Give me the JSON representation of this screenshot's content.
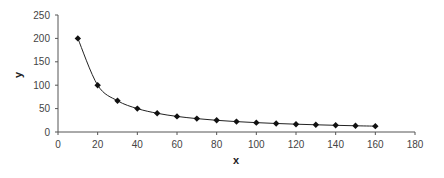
{
  "chart_data": {
    "type": "line",
    "title": "",
    "xlabel": "x",
    "ylabel": "y",
    "xlim": [
      0,
      180
    ],
    "ylim": [
      0,
      250
    ],
    "x_ticks": [
      0,
      20,
      40,
      60,
      80,
      100,
      120,
      140,
      160,
      180
    ],
    "y_ticks": [
      0,
      50,
      100,
      150,
      200,
      250
    ],
    "grid": false,
    "legend": null,
    "marker": "diamond",
    "smooth": true,
    "series": [
      {
        "name": "y",
        "x": [
          10,
          20,
          30,
          40,
          50,
          60,
          70,
          80,
          90,
          100,
          110,
          120,
          130,
          140,
          150,
          160
        ],
        "values": [
          200,
          100,
          66.7,
          50,
          40,
          33.3,
          28.6,
          25,
          22.2,
          20,
          18.2,
          16.7,
          15.4,
          14.3,
          13.3,
          12.5
        ]
      }
    ]
  },
  "colors": {
    "line": "#222222",
    "marker": "#111111",
    "axis": "#555555"
  }
}
